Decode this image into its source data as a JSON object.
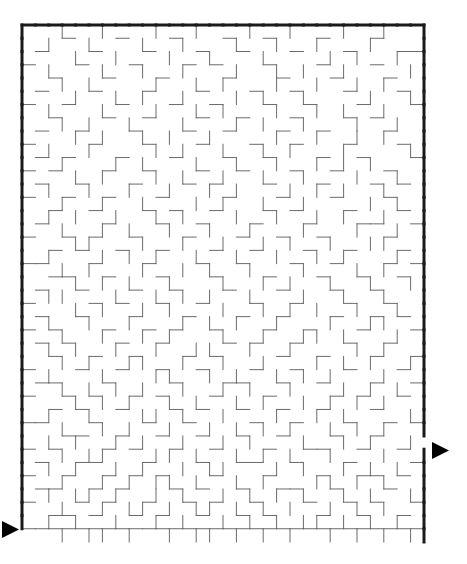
{
  "page": {
    "background_color": "#ffffff",
    "width": 467,
    "height": 564
  },
  "maze": {
    "type": "rectangular-perfect-maze",
    "cols": 30,
    "rows": 39,
    "cell_size": 13.4,
    "origin_x": 22,
    "origin_y": 25,
    "width_px": 402,
    "height_px": 517,
    "border_color": "#1a1a1a",
    "border_width": 3,
    "wall_color": "#6a6a6a",
    "wall_width": 1,
    "entrance": {
      "label": "entrance",
      "side": "left",
      "cell_row": 37,
      "arrow_direction": "right",
      "arrow_color": "#000000",
      "arrow_x": 2,
      "arrow_y": 521,
      "arrow_size": 17
    },
    "exit": {
      "label": "exit",
      "side": "right",
      "cell_row": 31,
      "arrow_direction": "right",
      "arrow_color": "#000000",
      "arrow_x": 432,
      "arrow_y": 442,
      "arrow_size": 17
    },
    "h_walls": [
      "111111111111111111111111111111",
      "000100010001000100100010001000",
      "010001000100010010001000100011",
      "100010001000101000100010001000",
      "001000100010000100010001000100",
      "010001000100010001001000100010",
      "100100010001001000100100010001",
      "001000100100010010001000101000",
      "010010001000100100010010000100",
      "100001000100010001001000100010",
      "010100010001000100100010010001",
      "101000100100010010001001000100",
      "010010001000101000100010001010",
      "100100100010000100010001000100",
      "001001000101001000101000100010",
      "010000100010010001000100011001",
      "100101001000100010010010000100",
      "001010010010001001000100100010",
      "110001000100010010001001000101",
      "001100100010001000100010010010",
      "010010001001000100010001001000",
      "100001010010010001001000100100",
      "010010001000100010010001001010",
      "101000100101001000100100010001",
      "010100010010000101001000100100",
      "001001001000101000010010001001",
      "100010010010010001001000100010",
      "011000100001000110010010001001",
      "100101001010001000100001010010",
      "001010010001010010010010001000",
      "110001000100100001001000100101",
      "000110010010010010010001001000",
      "101000101001001000100110010010",
      "010011000100010011001000100001",
      "100100101010001000100010011010",
      "011001010001010010011001000100",
      "100010100100101001000100101001",
      "001101001010010010100010010010",
      "111111111111111111111111111111"
    ],
    "v_walls": [
      "1001001000100100010010001001001",
      "1010010001001000100100100010001",
      "1000100100010010001000010100101",
      "1010001001001000100101001000011",
      "1001010000100101000100100101001",
      "1000100101001000101001000010011",
      "1010001000100101000100101001001",
      "1001010010001000101001000100101",
      "1000101001010010000100100101001",
      "1010010000101001001010001000011",
      "1001000101000100100100101010001",
      "1000101000101001001001000100101",
      "1010010010010010100010101001001",
      "1001001001000101001001000010101",
      "1010100100101000100100101001001",
      "1001001010010010010001000100101",
      "1000110001001001001010010011001",
      "1010001010100100100100101000101",
      "1001010001001010010001000101001",
      "1000101010010001001010010010011",
      "1011000100101010010001001001001",
      "1000101001010001001010100100101",
      "1010010010001010100100010011001",
      "1001001001010001001001101000101",
      "1010100100100110010010000101001",
      "1001010011001001001000101010011",
      "1010001000110010100101010001001",
      "1001010101001001010010001010101",
      "1000101010010100101001010101001",
      "1010010001101001000100101000011",
      "1001001010010010101010010101001",
      "1010100101001001010001001010010",
      "1001011000110100101010010001001",
      "1010100101001011000101001010101",
      "1001001010110100101000110101001",
      "1010110100101001010101001010011",
      "1001001011010110101010010101001",
      "1010100100101001010101101010101",
      "0001011010010110101010010101011"
    ]
  }
}
